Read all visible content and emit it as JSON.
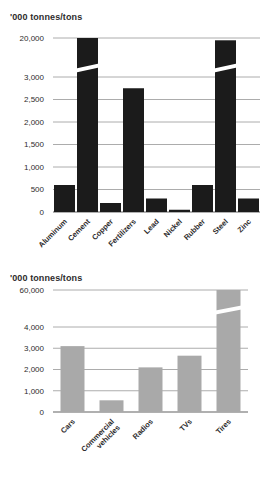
{
  "page": {
    "background": "#ffffff",
    "text_color": "#2e2c2d",
    "gridline_color": "#a3a3a3"
  },
  "chart_data": [
    {
      "type": "bar",
      "title": "'000 tonnes/tons",
      "categories": [
        "Aluminum",
        "Cement",
        "Copper",
        "Fertilizers",
        "Lead",
        "Nickel",
        "Rubber",
        "Steel",
        "Zinc"
      ],
      "values": [
        600,
        20000,
        200,
        2750,
        300,
        50,
        600,
        19000,
        300
      ],
      "bar_color": "#1b1b1b",
      "yticks": [
        {
          "value": 0,
          "label": "0"
        },
        {
          "value": 500,
          "label": "500"
        },
        {
          "value": 1000,
          "label": "1,000"
        },
        {
          "value": 1500,
          "label": "1,500"
        },
        {
          "value": 2000,
          "label": "2,000"
        },
        {
          "value": 2500,
          "label": "2,500"
        },
        {
          "value": 3000,
          "label": "3,000"
        },
        {
          "value": 20000,
          "label": "20,000"
        }
      ],
      "axis_break": {
        "lower": 3000,
        "upper": 20000
      },
      "ylim": [
        0,
        20000
      ],
      "grid": true,
      "legend": false,
      "xlabel": "",
      "ylabel": "'000 tonnes/tons"
    },
    {
      "type": "bar",
      "title": "'000 tonnes/tons",
      "categories": [
        "Cars",
        "Commercial\nvehicles",
        "Radios",
        "TVs",
        "Tires"
      ],
      "values": [
        3100,
        550,
        2100,
        2650,
        60000
      ],
      "bar_color": "#a9a9a9",
      "yticks": [
        {
          "value": 0,
          "label": "0"
        },
        {
          "value": 1000,
          "label": "1,000"
        },
        {
          "value": 2000,
          "label": "2,000"
        },
        {
          "value": 3000,
          "label": "3,000"
        },
        {
          "value": 4000,
          "label": "4,000"
        },
        {
          "value": 60000,
          "label": "60,000"
        }
      ],
      "axis_break": {
        "lower": 4000,
        "upper": 60000
      },
      "ylim": [
        0,
        60000
      ],
      "grid": true,
      "legend": false,
      "xlabel": "",
      "ylabel": "'000 tonnes/tons"
    }
  ]
}
